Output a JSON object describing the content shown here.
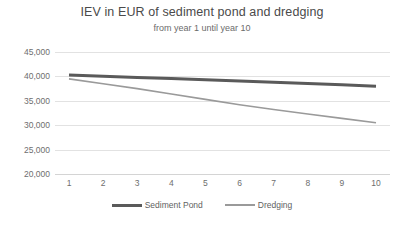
{
  "chart_data": {
    "type": "line",
    "title": "IEV in EUR of sediment pond and dredging",
    "subtitle": "from year 1 until year 10",
    "xlabel": "",
    "ylabel": "",
    "x": [
      1,
      2,
      3,
      4,
      5,
      6,
      7,
      8,
      9,
      10
    ],
    "categories": [
      "1",
      "2",
      "3",
      "4",
      "5",
      "6",
      "7",
      "8",
      "9",
      "10"
    ],
    "xtick_labels": [
      "1",
      "2",
      "3",
      "4",
      "5",
      "6",
      "7",
      "8",
      "9",
      "10"
    ],
    "ytick_labels": [
      "45,000",
      "40,000",
      "35,000",
      "30,000",
      "25,000",
      "20,000"
    ],
    "ytick_values": [
      45000,
      40000,
      35000,
      30000,
      25000,
      20000
    ],
    "ylim": [
      20000,
      45000
    ],
    "grid": true,
    "legend_position": "bottom",
    "series": [
      {
        "name": "Sediment Pond",
        "color": "#5a5a5a",
        "width": 3,
        "values": [
          40300,
          40050,
          39800,
          39550,
          39300,
          39050,
          38800,
          38550,
          38300,
          38000
        ]
      },
      {
        "name": "Dredging",
        "color": "#9a9a9a",
        "width": 1.6,
        "values": [
          39500,
          38500,
          37500,
          36400,
          35300,
          34200,
          33200,
          32300,
          31400,
          30500
        ]
      }
    ]
  },
  "colors": {
    "background": "#ffffff",
    "gridline": "#e2e2e2",
    "axis": "#d4d4d4",
    "text": "#6e6e6e",
    "title": "#4a4a4a",
    "series_sediment_pond": "#5a5a5a",
    "series_dredging": "#9a9a9a"
  }
}
